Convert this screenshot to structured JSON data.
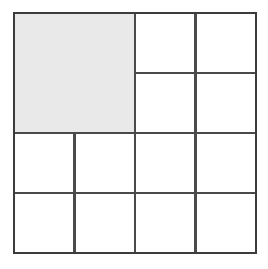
{
  "figure": {
    "canvas": {
      "width": 268,
      "height": 269,
      "background": "#ffffff"
    },
    "style": {
      "line_color": "#4a4a4a",
      "outer_line_color": "#3c3c3c",
      "line_width": 2.2,
      "outer_line_width": 2.6,
      "shaded_fill": "#e9e9e9",
      "unshaded_fill": "#ffffff"
    },
    "outer_square": {
      "label": "outer-square",
      "x": 14,
      "y": 13,
      "width": 242,
      "height": 240
    },
    "grid": {
      "columns": 4,
      "rows": 4,
      "unit_size": 60.5,
      "vertical_line_x": [
        14,
        74.5,
        135,
        195.5,
        256
      ],
      "horizontal_line_y": [
        13,
        73,
        133,
        193,
        253
      ]
    },
    "cells": [
      {
        "name": "shaded-large-square",
        "x": 14,
        "y": 13,
        "width": 121,
        "height": 120,
        "shaded": true,
        "units": 4
      },
      {
        "name": "cell-r1c3",
        "x": 135,
        "y": 13,
        "width": 60.5,
        "height": 60,
        "shaded": false,
        "units": 1
      },
      {
        "name": "cell-r1c4",
        "x": 195.5,
        "y": 13,
        "width": 60.5,
        "height": 60,
        "shaded": false,
        "units": 1
      },
      {
        "name": "cell-r2c3",
        "x": 135,
        "y": 73,
        "width": 60.5,
        "height": 60,
        "shaded": false,
        "units": 1
      },
      {
        "name": "cell-r2c4",
        "x": 195.5,
        "y": 73,
        "width": 60.5,
        "height": 60,
        "shaded": false,
        "units": 1
      },
      {
        "name": "cell-r3c1",
        "x": 14,
        "y": 133,
        "width": 60.5,
        "height": 60,
        "shaded": false,
        "units": 1
      },
      {
        "name": "cell-r3c2",
        "x": 74.5,
        "y": 133,
        "width": 60.5,
        "height": 60,
        "shaded": false,
        "units": 1
      },
      {
        "name": "cell-r3c3",
        "x": 135,
        "y": 133,
        "width": 60.5,
        "height": 60,
        "shaded": false,
        "units": 1
      },
      {
        "name": "cell-r3c4",
        "x": 195.5,
        "y": 133,
        "width": 60.5,
        "height": 60,
        "shaded": false,
        "units": 1
      },
      {
        "name": "cell-r4c1",
        "x": 14,
        "y": 193,
        "width": 60.5,
        "height": 60,
        "shaded": false,
        "units": 1
      },
      {
        "name": "cell-r4c2",
        "x": 74.5,
        "y": 193,
        "width": 60.5,
        "height": 60,
        "shaded": false,
        "units": 1
      },
      {
        "name": "cell-r4c3",
        "x": 135,
        "y": 193,
        "width": 60.5,
        "height": 60,
        "shaded": false,
        "units": 1
      },
      {
        "name": "cell-r4c4",
        "x": 195.5,
        "y": 193,
        "width": 60.5,
        "height": 60,
        "shaded": false,
        "units": 1
      }
    ],
    "counts": {
      "total_regions": 13,
      "shaded_regions": 1,
      "unshaded_regions": 12
    }
  }
}
